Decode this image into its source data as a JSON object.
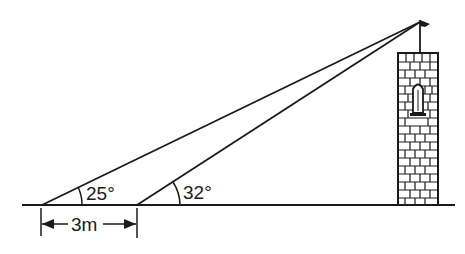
{
  "diagram": {
    "type": "angle-of-elevation",
    "angles": [
      {
        "label": "25°",
        "value": 25,
        "position": "far observation point"
      },
      {
        "label": "32°",
        "value": 32,
        "position": "near observation point"
      }
    ],
    "distance": {
      "label": "3m",
      "value": 3,
      "unit": "m"
    },
    "colors": {
      "ink": "#1a1a1a",
      "background": "#ffffff"
    }
  }
}
